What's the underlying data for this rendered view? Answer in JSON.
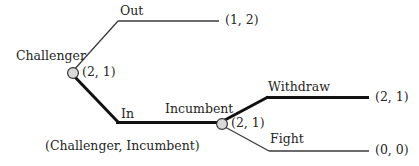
{
  "figure": {
    "kind": "extensive-form-game-tree",
    "background_color": "#ffffff",
    "line_color_thin": "#3a3a3a",
    "line_color_bold": "#111111",
    "node_fill": "#d9d9d9",
    "node_stroke": "#333333"
  },
  "nodes": {
    "challenger": {
      "player_label": "Challenger",
      "equilibrium_payoff": "(2, 1)"
    },
    "incumbent": {
      "player_label": "Incumbent",
      "equilibrium_payoff": "(2, 1)"
    }
  },
  "branches": {
    "out": {
      "action_label": "Out",
      "payoff": "(1, 2)",
      "highlighted": false
    },
    "in": {
      "action_label": "In",
      "highlighted": true
    },
    "withdraw": {
      "action_label": "Withdraw",
      "payoff": "(2, 1)",
      "highlighted": true
    },
    "fight": {
      "action_label": "Fight",
      "payoff": "(0, 0)",
      "highlighted": false
    }
  },
  "caption": {
    "payoff_order": "(Challenger, Incumbent)"
  }
}
